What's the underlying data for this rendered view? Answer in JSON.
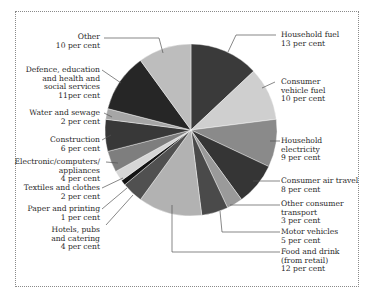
{
  "chart_data": {
    "type": "pie",
    "title": "",
    "unit": "per cent",
    "start_angle_deg": 0,
    "direction": "clockwise",
    "slices": [
      {
        "label": "Household fuel",
        "value": 13,
        "color": "#3a3a3a"
      },
      {
        "label": "Consumer vehicle fuel",
        "value": 10,
        "color": "#cfcfcf"
      },
      {
        "label": "Household electricity",
        "value": 9,
        "color": "#8a8a8a"
      },
      {
        "label": "Consumer air travel",
        "value": 8,
        "color": "#353535"
      },
      {
        "label": "Other consumer transport",
        "value": 3,
        "color": "#9a9a9a"
      },
      {
        "label": "Motor vehicles",
        "value": 5,
        "color": "#4a4a4a"
      },
      {
        "label": "Food and drink (from retail)",
        "value": 12,
        "color": "#b2b2b2"
      },
      {
        "label": "Hotels, pubs and catering",
        "value": 4,
        "color": "#505050"
      },
      {
        "label": "Paper and printing",
        "value": 1,
        "color": "#141414"
      },
      {
        "label": "Textiles and clothes",
        "value": 2,
        "color": "#d6d6d6"
      },
      {
        "label": "Electronic/computers/appliances",
        "value": 4,
        "color": "#7e7e7e"
      },
      {
        "label": "Construction",
        "value": 6,
        "color": "#383838"
      },
      {
        "label": "Water and sewage",
        "value": 2,
        "color": "#a6a6a6"
      },
      {
        "label": "Defence, education and health and social services",
        "value": 11,
        "color": "#262626"
      },
      {
        "label": "Other",
        "value": 10,
        "color": "#bdbdbd"
      }
    ]
  },
  "labels": {
    "household_fuel": {
      "lines": "Household fuel\n13 per cent"
    },
    "consumer_vehicle_fuel": {
      "lines": "Consumer\nvehicle fuel\n10 per cent"
    },
    "household_electricity": {
      "lines": "Household\nelectricity\n9 per cent"
    },
    "consumer_air_travel": {
      "lines": "Consumer air travel\n8 per cent"
    },
    "other_consumer_transport": {
      "lines": "Other consumer\ntransport\n3 per cent"
    },
    "motor_vehicles": {
      "lines": "Motor vehicles\n5 per cent"
    },
    "food_and_drink": {
      "lines": "Food and drink\n(from retail)\n12 per cent"
    },
    "hotels": {
      "lines": "Hotels, pubs\nand catering\n4 per cent"
    },
    "paper": {
      "lines": "Paper and printing\n1 per cent"
    },
    "textiles": {
      "lines": "Textiles and clothes\n2 per cent"
    },
    "electronic": {
      "lines": "Electronic/computers/\nappliances\n4 per cent"
    },
    "construction": {
      "lines": "Construction\n6 per cent"
    },
    "water": {
      "lines": "Water and sewage\n2 per cent"
    },
    "defence": {
      "lines": "Defence, education\nand health and\nsocial services\n11per cent"
    },
    "other": {
      "lines": "Other\n10 per cent"
    }
  }
}
